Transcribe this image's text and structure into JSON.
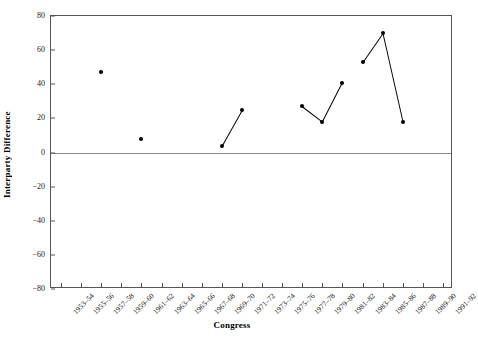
{
  "chart_data": {
    "type": "scatter",
    "title": "",
    "xlabel": "Congress",
    "ylabel": "Interparty Difference",
    "ylim": [
      -80,
      80
    ],
    "yticks": [
      80,
      60,
      40,
      20,
      0,
      -20,
      -40,
      -60,
      -80
    ],
    "ytick_labels": [
      "80",
      "60",
      "40",
      "20",
      "0",
      "−20",
      "−40",
      "−60",
      "−80"
    ],
    "grid": false,
    "legend": null,
    "zero_line": true,
    "categories": [
      "1953–54",
      "1955–56",
      "1957–58",
      "1959–60",
      "1961–62",
      "1963–64",
      "1965–66",
      "1967–68",
      "1969–70",
      "1971–72",
      "1973–74",
      "1975–76",
      "1977–78",
      "1979–80",
      "1981–82",
      "1983–84",
      "1985–86",
      "1987–88",
      "1989–90",
      "1991–92"
    ],
    "series": [
      {
        "name": "Interparty Difference",
        "points": [
          {
            "category": "1957–58",
            "x_index": 2,
            "value": 47
          },
          {
            "category": "1961–62",
            "x_index": 4,
            "value": 8
          },
          {
            "category": "1969–70",
            "x_index": 8,
            "value": 4
          },
          {
            "category": "1971–72",
            "x_index": 9,
            "value": 25
          },
          {
            "category": "1977–78",
            "x_index": 12,
            "value": 27
          },
          {
            "category": "1979–80",
            "x_index": 13,
            "value": 18
          },
          {
            "category": "1981–82",
            "x_index": 14,
            "value": 41
          },
          {
            "category": "1983–84",
            "x_index": 15,
            "value": 53
          },
          {
            "category": "1985–86",
            "x_index": 16,
            "value": 70
          },
          {
            "category": "1987–88",
            "x_index": 17,
            "value": 18
          }
        ],
        "connections": [
          [
            8,
            9
          ],
          [
            12,
            13
          ],
          [
            13,
            14
          ],
          [
            15,
            16
          ],
          [
            16,
            17
          ]
        ],
        "marker_color": "#000000",
        "line_color": "#000000"
      }
    ]
  }
}
